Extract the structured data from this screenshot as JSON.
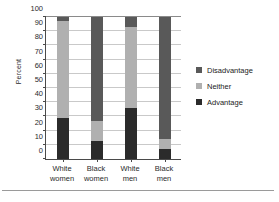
{
  "chart_data": {
    "type": "bar",
    "subtype": "stacked-bar-100",
    "title": "",
    "xlabel": "",
    "ylabel": "Percent",
    "ylim": [
      0,
      100
    ],
    "ytick_step": 10,
    "yticks": [
      "0",
      "10",
      "20",
      "30",
      "40",
      "50",
      "60",
      "70",
      "80",
      "90",
      "100"
    ],
    "grid": true,
    "legend_position": "right",
    "categories": [
      "White women",
      "Black women",
      "White men",
      "Black men"
    ],
    "category_lines": [
      [
        "White",
        "women"
      ],
      [
        "Black",
        "women"
      ],
      [
        "White",
        "men"
      ],
      [
        "Black",
        "men"
      ]
    ],
    "series": [
      {
        "name": "Disadvantage",
        "color": "#595959",
        "values": [
          3,
          73,
          7,
          86
        ]
      },
      {
        "name": "Neither",
        "color": "#b0b0b0",
        "values": [
          68,
          14,
          57,
          7
        ]
      },
      {
        "name": "Advantage",
        "color": "#2b2b2b",
        "values": [
          29,
          13,
          36,
          7
        ]
      }
    ],
    "stack_order_bottom_to_top": [
      "Advantage",
      "Neither",
      "Disadvantage"
    ]
  },
  "legend": {
    "items": [
      {
        "label": "Disadvantage",
        "color": "#595959"
      },
      {
        "label": "Neither",
        "color": "#b0b0b0"
      },
      {
        "label": "Advantage",
        "color": "#2b2b2b"
      }
    ]
  },
  "axes": {
    "y_title": "Percent"
  }
}
